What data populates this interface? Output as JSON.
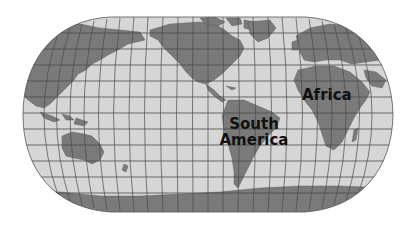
{
  "map": {
    "projection": "Robinson (Americas-centered)",
    "style": "grayscale",
    "colors": {
      "background": "#ffffff",
      "ocean": "#d6d6d6",
      "land": "#7a7a7a",
      "graticule": "#4a4a4a",
      "label": "#111111"
    },
    "graticule": {
      "meridian_count": 24,
      "parallel_count": 12
    },
    "labels": [
      {
        "id": "africa",
        "text": "Africa"
      },
      {
        "id": "south-america",
        "lines": [
          "South",
          "America"
        ]
      }
    ]
  }
}
